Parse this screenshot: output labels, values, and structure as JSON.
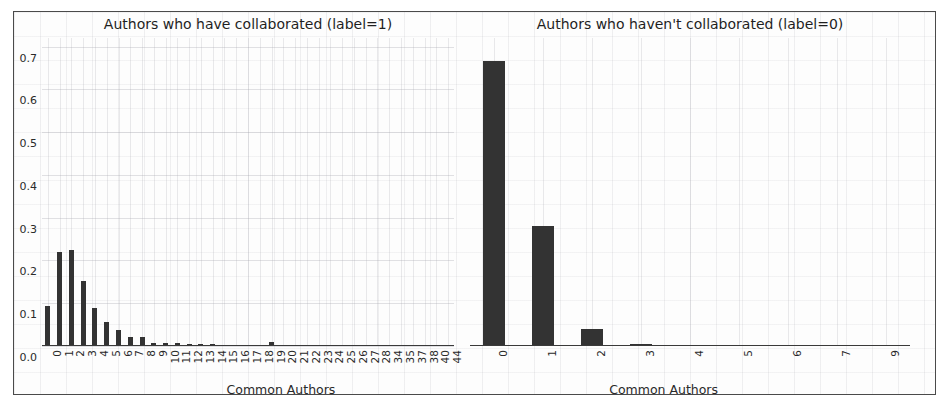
{
  "figure": {
    "background_color": "#fdfdfd",
    "border_color": "#4a4a4a",
    "bar_color": "#333333"
  },
  "chart_data": [
    {
      "type": "bar",
      "title": "Authors who have collaborated (label=1)",
      "xlabel": "Common Authors",
      "ylabel": "",
      "ylim": [
        0.0,
        0.72
      ],
      "yticks": [
        "0.0",
        "0.1",
        "0.2",
        "0.3",
        "0.4",
        "0.5",
        "0.6",
        "0.7"
      ],
      "ytick_values": [
        0.0,
        0.1,
        0.2,
        0.3,
        0.4,
        0.5,
        0.6,
        0.7
      ],
      "grid": true,
      "legend": "none",
      "categories": [
        "0",
        "1",
        "2",
        "3",
        "4",
        "5",
        "6",
        "7",
        "8",
        "9",
        "10",
        "11",
        "12",
        "13",
        "14",
        "15",
        "16",
        "17",
        "18",
        "19",
        "20",
        "21",
        "22",
        "23",
        "24",
        "25",
        "26",
        "27",
        "28",
        "34",
        "35",
        "37",
        "38",
        "40",
        "44"
      ],
      "values": [
        0.093,
        0.219,
        0.225,
        0.152,
        0.088,
        0.056,
        0.038,
        0.021,
        0.02,
        0.007,
        0.008,
        0.007,
        0.004,
        0.004,
        0.004,
        0.002,
        0.002,
        0.002,
        0.002,
        0.009,
        0.002,
        0.001,
        0.001,
        0.001,
        0.001,
        0.001,
        0.001,
        0.003,
        0.001,
        0.002,
        0.001,
        0.001,
        0.001,
        0.001,
        0.001
      ]
    },
    {
      "type": "bar",
      "title": "Authors who haven't collaborated (label=0)",
      "xlabel": "Common Authors",
      "ylabel": "",
      "ylim": [
        0.0,
        0.72
      ],
      "yticks": [],
      "ytick_values": [],
      "grid": true,
      "legend": "none",
      "categories": [
        "0",
        "1",
        "2",
        "3",
        "4",
        "5",
        "6",
        "7",
        "9"
      ],
      "values": [
        0.667,
        0.28,
        0.04,
        0.005,
        0.0,
        0.0,
        0.0,
        0.0,
        0.0
      ]
    }
  ]
}
